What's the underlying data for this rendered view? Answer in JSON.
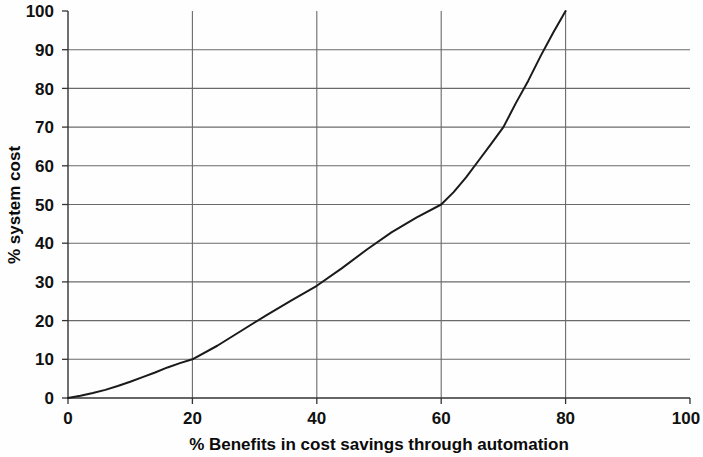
{
  "chart_data": {
    "type": "line",
    "title": "",
    "subtitle": "",
    "xlabel": "% Benefits in cost savings through automation",
    "ylabel": "% system cost",
    "xlim": [
      0,
      100
    ],
    "ylim": [
      0,
      100
    ],
    "xticks": [
      0,
      20,
      40,
      60,
      80,
      100
    ],
    "yticks": [
      0,
      10,
      20,
      30,
      40,
      50,
      60,
      70,
      80,
      90,
      100
    ],
    "xtick_labels": [
      "0",
      "20",
      "40",
      "60",
      "80",
      "100"
    ],
    "ytick_labels": [
      "0",
      "10",
      "20",
      "30",
      "40",
      "50",
      "60",
      "70",
      "80",
      "90",
      "100"
    ],
    "grid": {
      "horizontal": true,
      "vertical": true,
      "color": "#6a6a6a"
    },
    "legend": {
      "visible": false,
      "position": "none",
      "entries": []
    },
    "annotations": [],
    "series": [
      {
        "name": "cost curve",
        "color": "#1a1a1a",
        "line_width": 2,
        "markers": false,
        "x": [
          0,
          2,
          4,
          6,
          8,
          10,
          12,
          14,
          16,
          18,
          20,
          24,
          28,
          32,
          36,
          40,
          44,
          48,
          52,
          56,
          60,
          62,
          64,
          66,
          68,
          70,
          72,
          74,
          76,
          78,
          80
        ],
        "y": [
          0,
          0.6,
          1.3,
          2.1,
          3.1,
          4.2,
          5.4,
          6.6,
          7.9,
          9.0,
          10.0,
          13.5,
          17.5,
          21.5,
          25.3,
          29.0,
          33.5,
          38.3,
          42.8,
          46.6,
          50.0,
          53.2,
          57.0,
          61.3,
          65.6,
          70.0,
          76.2,
          82.0,
          88.4,
          94.4,
          100.0
        ]
      }
    ],
    "key_points": [
      {
        "x": 0,
        "y": 0
      },
      {
        "x": 20,
        "y": 10
      },
      {
        "x": 40,
        "y": 29
      },
      {
        "x": 60,
        "y": 50
      },
      {
        "x": 70,
        "y": 70
      },
      {
        "x": 80,
        "y": 100
      }
    ]
  },
  "axes": {
    "y_axis_label": "% system cost",
    "x_axis_label": "% Benefits in cost savings through automation",
    "y_ticks": [
      "100",
      "90",
      "80",
      "70",
      "60",
      "50",
      "40",
      "30",
      "20",
      "10",
      "0"
    ],
    "x_ticks": [
      "0",
      "20",
      "40",
      "60",
      "80",
      "100"
    ]
  },
  "colors": {
    "background": "#fefefe",
    "axis": "#333333",
    "grid": "#6a6a6a",
    "curve": "#1a1a1a",
    "text": "#111111"
  }
}
